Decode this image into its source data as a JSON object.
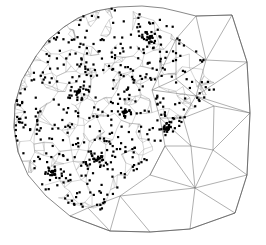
{
  "figure": {
    "title": "",
    "type": "triangular-mesh-with-scatter-points",
    "background_color": "#ffffff",
    "edge_color": "#6e6e6e",
    "fine_edge_color": "#9a9a9a",
    "point_color": "#000000",
    "point_size_px": 2.2,
    "width": 266,
    "height": 245
  },
  "chart_data": {
    "type": "scatter",
    "title": "",
    "xlabel": "",
    "ylabel": "",
    "xlim": [
      0,
      266
    ],
    "ylim": [
      0,
      245
    ],
    "grid": false,
    "legend": null,
    "domain_boundary": [
      [
        64,
        27
      ],
      [
        78,
        18
      ],
      [
        96,
        11
      ],
      [
        118,
        7
      ],
      [
        142,
        6
      ],
      [
        163,
        8
      ],
      [
        180,
        12
      ],
      [
        196,
        16
      ],
      [
        232,
        15
      ],
      [
        247,
        62
      ],
      [
        250,
        113
      ],
      [
        247,
        175
      ],
      [
        235,
        213
      ],
      [
        190,
        229
      ],
      [
        150,
        232
      ],
      [
        110,
        231
      ],
      [
        70,
        216
      ],
      [
        46,
        196
      ],
      [
        28,
        175
      ],
      [
        18,
        152
      ],
      [
        14,
        128
      ],
      [
        15,
        104
      ],
      [
        22,
        80
      ],
      [
        36,
        56
      ],
      [
        48,
        40
      ]
    ],
    "coarse_mesh_nodes": [
      [
        196,
        16
      ],
      [
        232,
        15
      ],
      [
        247,
        62
      ],
      [
        250,
        113
      ],
      [
        247,
        175
      ],
      [
        235,
        213
      ],
      [
        190,
        229
      ],
      [
        150,
        232
      ],
      [
        110,
        231
      ],
      [
        176,
        39
      ],
      [
        206,
        60
      ],
      [
        196,
        96
      ],
      [
        214,
        106
      ],
      [
        183,
        118
      ],
      [
        191,
        146
      ],
      [
        213,
        150
      ],
      [
        165,
        146
      ],
      [
        150,
        175
      ],
      [
        195,
        188
      ],
      [
        120,
        196
      ],
      [
        88,
        208
      ],
      [
        70,
        216
      ],
      [
        160,
        118
      ],
      [
        176,
        79
      ],
      [
        152,
        90
      ]
    ],
    "coarse_mesh_edges": [
      [
        [
          196,
          16
        ],
        [
          232,
          15
        ]
      ],
      [
        [
          232,
          15
        ],
        [
          247,
          62
        ]
      ],
      [
        [
          247,
          62
        ],
        [
          250,
          113
        ]
      ],
      [
        [
          250,
          113
        ],
        [
          247,
          175
        ]
      ],
      [
        [
          247,
          175
        ],
        [
          235,
          213
        ]
      ],
      [
        [
          235,
          213
        ],
        [
          190,
          229
        ]
      ],
      [
        [
          190,
          229
        ],
        [
          150,
          232
        ]
      ],
      [
        [
          150,
          232
        ],
        [
          110,
          231
        ]
      ],
      [
        [
          110,
          231
        ],
        [
          70,
          216
        ]
      ],
      [
        [
          196,
          16
        ],
        [
          176,
          39
        ]
      ],
      [
        [
          176,
          39
        ],
        [
          206,
          60
        ]
      ],
      [
        [
          206,
          60
        ],
        [
          232,
          15
        ]
      ],
      [
        [
          196,
          16
        ],
        [
          206,
          60
        ]
      ],
      [
        [
          176,
          39
        ],
        [
          152,
          90
        ]
      ],
      [
        [
          152,
          90
        ],
        [
          176,
          79
        ]
      ],
      [
        [
          176,
          79
        ],
        [
          206,
          60
        ]
      ],
      [
        [
          176,
          39
        ],
        [
          176,
          79
        ]
      ],
      [
        [
          206,
          60
        ],
        [
          247,
          62
        ]
      ],
      [
        [
          206,
          60
        ],
        [
          196,
          96
        ]
      ],
      [
        [
          196,
          96
        ],
        [
          247,
          62
        ]
      ],
      [
        [
          196,
          96
        ],
        [
          214,
          106
        ]
      ],
      [
        [
          214,
          106
        ],
        [
          250,
          113
        ]
      ],
      [
        [
          196,
          96
        ],
        [
          250,
          113
        ]
      ],
      [
        [
          176,
          79
        ],
        [
          196,
          96
        ]
      ],
      [
        [
          152,
          90
        ],
        [
          196,
          96
        ]
      ],
      [
        [
          196,
          96
        ],
        [
          183,
          118
        ]
      ],
      [
        [
          183,
          118
        ],
        [
          214,
          106
        ]
      ],
      [
        [
          214,
          106
        ],
        [
          213,
          150
        ]
      ],
      [
        [
          213,
          150
        ],
        [
          250,
          113
        ]
      ],
      [
        [
          213,
          150
        ],
        [
          247,
          175
        ]
      ],
      [
        [
          183,
          118
        ],
        [
          191,
          146
        ]
      ],
      [
        [
          191,
          146
        ],
        [
          213,
          150
        ]
      ],
      [
        [
          191,
          146
        ],
        [
          195,
          188
        ]
      ],
      [
        [
          195,
          188
        ],
        [
          213,
          150
        ]
      ],
      [
        [
          195,
          188
        ],
        [
          247,
          175
        ]
      ],
      [
        [
          195,
          188
        ],
        [
          235,
          213
        ]
      ],
      [
        [
          195,
          188
        ],
        [
          190,
          229
        ]
      ],
      [
        [
          160,
          118
        ],
        [
          183,
          118
        ]
      ],
      [
        [
          160,
          118
        ],
        [
          191,
          146
        ]
      ],
      [
        [
          165,
          146
        ],
        [
          191,
          146
        ]
      ],
      [
        [
          165,
          146
        ],
        [
          150,
          175
        ]
      ],
      [
        [
          150,
          175
        ],
        [
          195,
          188
        ]
      ],
      [
        [
          165,
          146
        ],
        [
          195,
          188
        ]
      ],
      [
        [
          150,
          175
        ],
        [
          120,
          196
        ]
      ],
      [
        [
          120,
          196
        ],
        [
          195,
          188
        ]
      ],
      [
        [
          120,
          196
        ],
        [
          150,
          232
        ]
      ],
      [
        [
          120,
          196
        ],
        [
          110,
          231
        ]
      ],
      [
        [
          88,
          208
        ],
        [
          120,
          196
        ]
      ],
      [
        [
          88,
          208
        ],
        [
          110,
          231
        ]
      ],
      [
        [
          70,
          216
        ],
        [
          88,
          208
        ]
      ],
      [
        [
          150,
          175
        ],
        [
          165,
          146
        ]
      ],
      [
        [
          152,
          90
        ],
        [
          160,
          118
        ]
      ],
      [
        [
          160,
          118
        ],
        [
          165,
          146
        ]
      ]
    ],
    "point_count_estimate": 620,
    "point_cluster_centers": [
      [
        52,
        172
      ],
      [
        96,
        160
      ],
      [
        125,
        112
      ],
      [
        168,
        128
      ],
      [
        150,
        38
      ],
      [
        78,
        92
      ]
    ]
  },
  "accessibility": {
    "alt": "Triangular finite element mesh over an irregular domain with dense scattered black data points in the refined left and upper regions."
  }
}
